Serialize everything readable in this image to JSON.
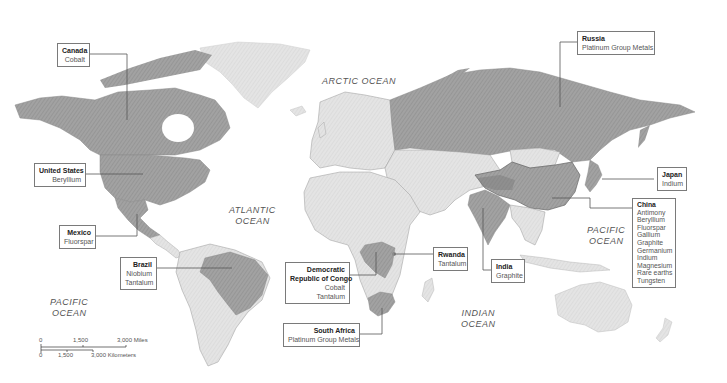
{
  "map": {
    "title": "",
    "oceans": [
      {
        "id": "arctic",
        "lines": [
          "ARCTIC  OCEAN"
        ]
      },
      {
        "id": "atlantic",
        "lines": [
          "ATLANTIC",
          "OCEAN"
        ]
      },
      {
        "id": "pacific-west",
        "lines": [
          "PACIFIC",
          "OCEAN"
        ]
      },
      {
        "id": "pacific-east",
        "lines": [
          "PACIFIC",
          "OCEAN"
        ]
      },
      {
        "id": "indian",
        "lines": [
          "INDIAN",
          "OCEAN"
        ]
      }
    ],
    "countries": [
      {
        "name": "Canada",
        "minerals": [
          "Cobalt"
        ]
      },
      {
        "name": "United States",
        "minerals": [
          "Beryllium"
        ]
      },
      {
        "name": "Mexico",
        "minerals": [
          "Fluorspar"
        ]
      },
      {
        "name": "Brazil",
        "minerals": [
          "Niobium",
          "Tantalum"
        ]
      },
      {
        "name_lines": [
          "Democratic",
          "Republic of Congo"
        ],
        "minerals": [
          "Cobalt",
          "Tantalum"
        ]
      },
      {
        "name": "Rwanda",
        "minerals": [
          "Tantalum"
        ]
      },
      {
        "name": "South Africa",
        "minerals": [
          "Platinum Group Metals"
        ]
      },
      {
        "name": "India",
        "minerals": [
          "Graphite"
        ]
      },
      {
        "name": "Russia",
        "minerals": [
          "Platinum Group Metals"
        ]
      },
      {
        "name": "Japan",
        "minerals": [
          "Indium"
        ]
      },
      {
        "name": "China",
        "minerals": [
          "Antimony",
          "Beryllium",
          "Fluorspar",
          "Gallium",
          "Graphite",
          "Germanium",
          "Indium",
          "Magnesium",
          "Rare earths",
          "Tungsten"
        ]
      }
    ],
    "scale_bar": {
      "miles": {
        "ticks": [
          "0",
          "1,500",
          "3,000 Miles"
        ]
      },
      "kilometers": {
        "ticks": [
          "0",
          "1,500",
          "3,000 Kilometers"
        ]
      }
    },
    "colors": {
      "highlighted_land": "#9a9a9a",
      "other_land": "#e2e2e2",
      "ice": "#ececec",
      "water": "#ffffff",
      "leader_line": "#555555",
      "box_border": "#7a7a7a"
    }
  }
}
